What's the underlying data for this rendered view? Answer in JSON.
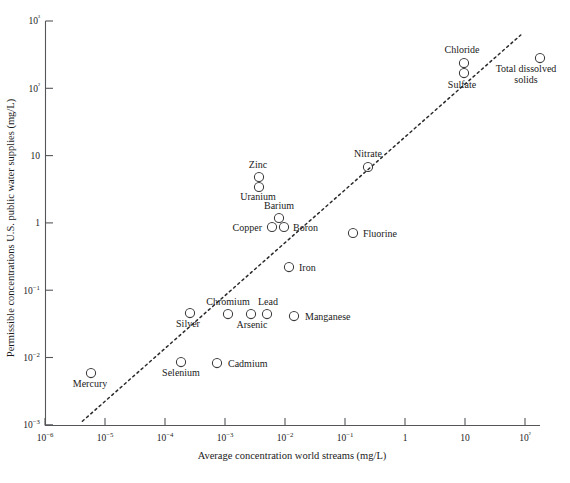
{
  "chart_data": {
    "type": "scatter",
    "title": "",
    "xlabel": "Average concentration world streams (mg/L)",
    "ylabel": "Permissible concentrations U.S. public water supplies (mg/L)",
    "xscale": "log",
    "yscale": "log",
    "xlim": [
      1e-06,
      100
    ],
    "ylim": [
      0.001,
      1000
    ],
    "grid": false,
    "legend": false,
    "xticklabels": [
      "10−6",
      "10−5",
      "10−4",
      "10−3",
      "10−2",
      "10−1",
      "1",
      "10",
      "10²"
    ],
    "yticklabels": [
      "10−3",
      "10−2",
      "10−1",
      "1",
      "10",
      "10²",
      "10³"
    ],
    "xticks": [
      1e-06,
      1e-05,
      0.0001,
      0.001,
      0.01,
      0.1,
      1,
      10,
      100
    ],
    "yticks": [
      0.001,
      0.01,
      0.1,
      1,
      10,
      100,
      1000
    ],
    "annotations": [
      {
        "text": "1:1 reference line (dotted)",
        "type": "trendline",
        "from": [
          4.2e-06,
          0.00113
        ],
        "to": [
          85.0,
          620.0
        ]
      }
    ],
    "points": [
      {
        "label": "Mercury",
        "x": 9.8e-06,
        "y": 0.0052,
        "px": 91,
        "py": 373,
        "label_dx": -1,
        "label_dy": 14,
        "anchor": "middle"
      },
      {
        "label": "Silver",
        "x": 0.00026,
        "y": 0.0442,
        "px": 190,
        "py": 313,
        "label_dx": -2,
        "label_dy": 14,
        "anchor": "middle"
      },
      {
        "label": "Selenium",
        "x": 0.00081,
        "y": 0.0093,
        "px": 181,
        "py": 362,
        "label_dx": 0,
        "label_dy": 14,
        "anchor": "middle"
      },
      {
        "label": "Cadmium",
        "x": 0.0027,
        "y": 0.0089,
        "px": 217,
        "py": 363,
        "label_dx": 11,
        "label_dy": 4,
        "anchor": "start"
      },
      {
        "label": "Chromium",
        "x": 0.0012,
        "y": 0.0434,
        "px": 228,
        "py": 314,
        "label_dx": 0,
        "label_dy": -9,
        "anchor": "middle"
      },
      {
        "label": "Arsenic",
        "x": 0.0028,
        "y": 0.0434,
        "px": 251,
        "py": 314,
        "label_dx": 1,
        "label_dy": 14,
        "anchor": "middle"
      },
      {
        "label": "Lead",
        "x": 0.0053,
        "y": 0.0434,
        "px": 267,
        "py": 314,
        "label_dx": 1,
        "label_dy": -9,
        "anchor": "middle"
      },
      {
        "label": "Manganese",
        "x": 0.0158,
        "y": 0.0421,
        "px": 294,
        "py": 316,
        "label_dx": 11,
        "label_dy": 4,
        "anchor": "start"
      },
      {
        "label": "Iron",
        "x": 0.0107,
        "y": 0.196,
        "px": 289,
        "py": 267,
        "label_dx": 10,
        "label_dy": 4,
        "anchor": "start"
      },
      {
        "label": "Copper",
        "x": 0.0029,
        "y": 0.96,
        "px": 272,
        "py": 227,
        "label_dx": -10,
        "label_dy": 4,
        "anchor": "end"
      },
      {
        "label": "Boron",
        "x": 0.0063,
        "y": 0.96,
        "px": 284,
        "py": 227,
        "label_dx": 9,
        "label_dy": 4,
        "anchor": "start"
      },
      {
        "label": "Barium",
        "x": 0.0047,
        "y": 1.32,
        "px": 279,
        "py": 218,
        "label_dx": 0,
        "label_dy": -9,
        "anchor": "middle"
      },
      {
        "label": "Uranium",
        "x": 0.0016,
        "y": 3.0,
        "px": 259,
        "py": 187,
        "label_dx": -1,
        "label_dy": 13,
        "anchor": "middle"
      },
      {
        "label": "Zinc",
        "x": 0.0016,
        "y": 4.2,
        "px": 259,
        "py": 177,
        "label_dx": -1,
        "label_dy": -9,
        "anchor": "middle"
      },
      {
        "label": "Fluorine",
        "x": 0.148,
        "y": 0.82,
        "px": 353,
        "py": 233,
        "label_dx": 10,
        "label_dy": 4,
        "anchor": "start"
      },
      {
        "label": "Nitrate",
        "x": 0.29,
        "y": 6.7,
        "px": 368,
        "py": 167,
        "label_dx": 0,
        "label_dy": -10,
        "anchor": "middle"
      },
      {
        "label": "Sulfate",
        "x": 5.5,
        "y": 150.0,
        "px": 464,
        "py": 73,
        "label_dx": -2,
        "label_dy": 15,
        "anchor": "middle"
      },
      {
        "label": "Chloride",
        "x": 5.5,
        "y": 220.0,
        "px": 464,
        "py": 63,
        "label_dx": -2,
        "label_dy": -10,
        "anchor": "middle"
      },
      {
        "label": "Total dissolved\nsolids",
        "x": 57.0,
        "y": 290.0,
        "px": 540,
        "py": 58,
        "label_dx": -14,
        "label_dy": 14,
        "anchor": "middle"
      }
    ]
  },
  "axes": {
    "x_title": "Average concentration world streams (mg/L)",
    "y_title": "Permissible concentrations U.S. public water supplies (mg/L)"
  }
}
